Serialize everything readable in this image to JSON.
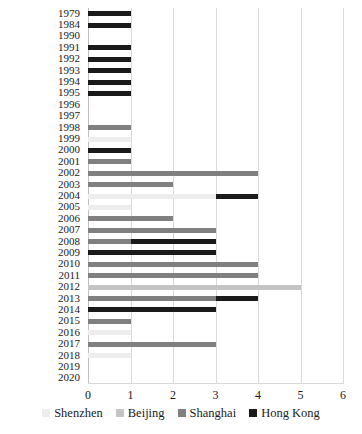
{
  "chart_data": {
    "type": "bar",
    "orientation": "horizontal",
    "stacked": true,
    "title": "",
    "subtitle": "",
    "xlabel": "",
    "ylabel": "",
    "xlim": [
      0,
      6
    ],
    "xticks": [
      "0",
      "1",
      "2",
      "3",
      "4",
      "5",
      "6"
    ],
    "grid": true,
    "legend_position": "bottom",
    "categories": [
      "1979",
      "1984",
      "1990",
      "1991",
      "1992",
      "1993",
      "1994",
      "1995",
      "1996",
      "1997",
      "1998",
      "1999",
      "2000",
      "2001",
      "2002",
      "2003",
      "2004",
      "2005",
      "2006",
      "2007",
      "2008",
      "2009",
      "2010",
      "2011",
      "2012",
      "2013",
      "2014",
      "2015",
      "2016",
      "2017",
      "2018",
      "2019",
      "2020"
    ],
    "series": [
      {
        "name": "Shenzhen",
        "color": "#ededed",
        "values": [
          0,
          0,
          0,
          0,
          0,
          0,
          0,
          0,
          0,
          0,
          0,
          1,
          0,
          0,
          0,
          0,
          3,
          1,
          0,
          0,
          0,
          0,
          0,
          0,
          0,
          0,
          0,
          0,
          1,
          0,
          1,
          0,
          0
        ]
      },
      {
        "name": "Beijing",
        "color": "#c4c4c4",
        "values": [
          0,
          0,
          0,
          0,
          0,
          0,
          0,
          0,
          0,
          0,
          0,
          0,
          0,
          0,
          0,
          0,
          0,
          0,
          0,
          0,
          0,
          0,
          0,
          0,
          5,
          0,
          0,
          0,
          0,
          0,
          0,
          0,
          0
        ]
      },
      {
        "name": "Shanghai",
        "color": "#808080",
        "values": [
          0,
          0,
          0,
          0,
          0,
          0,
          0,
          0,
          0,
          0,
          1,
          0,
          0,
          1,
          4,
          2,
          0,
          0,
          2,
          3,
          1,
          0,
          4,
          4,
          0,
          3,
          0,
          1,
          0,
          3,
          0,
          0,
          0
        ]
      },
      {
        "name": "Hong Kong",
        "color": "#1a1a1a",
        "values": [
          1,
          1,
          0,
          1,
          1,
          1,
          1,
          1,
          0,
          0,
          0,
          0,
          1,
          0,
          0,
          0,
          1,
          0,
          0,
          0,
          2,
          3,
          0,
          0,
          0,
          1,
          3,
          0,
          0,
          0,
          0,
          0,
          0
        ]
      }
    ],
    "totals": [
      1,
      1,
      0,
      1,
      1,
      1,
      1,
      1,
      0,
      0,
      1,
      1,
      1,
      1,
      4,
      2,
      4,
      1,
      2,
      3,
      3,
      3,
      4,
      4,
      5,
      4,
      3,
      1,
      1,
      3,
      1,
      0,
      0
    ]
  },
  "legend": {
    "items": [
      {
        "label": "Shenzhen"
      },
      {
        "label": "Beijing"
      },
      {
        "label": "Shanghai"
      },
      {
        "label": "Hong Kong"
      }
    ]
  }
}
